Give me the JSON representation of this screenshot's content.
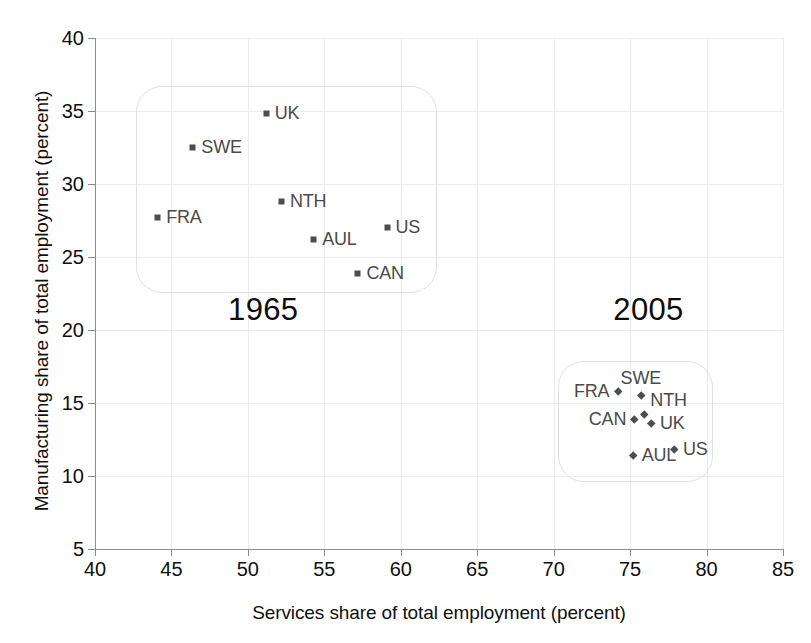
{
  "chart_data": {
    "type": "scatter",
    "title": "",
    "xlabel": "Services share of total employment (percent)",
    "ylabel": "Manufacturing share of total employment (percent)",
    "xlim": [
      40,
      85
    ],
    "ylim": [
      5,
      40
    ],
    "xticks": [
      40,
      45,
      50,
      55,
      60,
      65,
      70,
      75,
      80,
      85
    ],
    "yticks": [
      5,
      10,
      15,
      20,
      25,
      30,
      35,
      40
    ],
    "grid": true,
    "legend": "none",
    "annotations": [
      {
        "text": "1965",
        "x": 51.0,
        "y": 21.2
      },
      {
        "text": "2005",
        "x": 76.2,
        "y": 21.2
      }
    ],
    "groups": [
      {
        "name": "1965",
        "marker": "square",
        "color": "#4d4d4d",
        "box": {
          "x0": 42.7,
          "x1": 62.4,
          "y0": 22.5,
          "y1": 36.7
        },
        "points": [
          {
            "label": "UK",
            "x": 51.2,
            "y": 34.8,
            "label_pos": "right"
          },
          {
            "label": "SWE",
            "x": 46.4,
            "y": 32.5,
            "label_pos": "right"
          },
          {
            "label": "NTH",
            "x": 52.2,
            "y": 28.8,
            "label_pos": "right"
          },
          {
            "label": "FRA",
            "x": 44.1,
            "y": 27.7,
            "label_pos": "right"
          },
          {
            "label": "US",
            "x": 59.1,
            "y": 27.0,
            "label_pos": "right"
          },
          {
            "label": "AUL",
            "x": 54.3,
            "y": 26.2,
            "label_pos": "right"
          },
          {
            "label": "CAN",
            "x": 57.2,
            "y": 23.9,
            "label_pos": "right"
          }
        ]
      },
      {
        "name": "2005",
        "marker": "diamond",
        "color": "#4d4d4d",
        "box": {
          "x0": 70.3,
          "x1": 80.4,
          "y0": 9.6,
          "y1": 17.9
        },
        "points": [
          {
            "label": "FRA",
            "x": 74.2,
            "y": 15.8,
            "label_pos": "left"
          },
          {
            "label": "SWE",
            "x": 75.7,
            "y": 15.5,
            "label_pos": "above"
          },
          {
            "label": "NTH",
            "x": 75.9,
            "y": 14.2,
            "label_pos": "upright"
          },
          {
            "label": "CAN",
            "x": 75.3,
            "y": 13.9,
            "label_pos": "left"
          },
          {
            "label": "UK",
            "x": 76.4,
            "y": 13.6,
            "label_pos": "right"
          },
          {
            "label": "US",
            "x": 77.9,
            "y": 11.8,
            "label_pos": "right"
          },
          {
            "label": "AUL",
            "x": 75.2,
            "y": 11.4,
            "label_pos": "right"
          }
        ]
      }
    ]
  }
}
